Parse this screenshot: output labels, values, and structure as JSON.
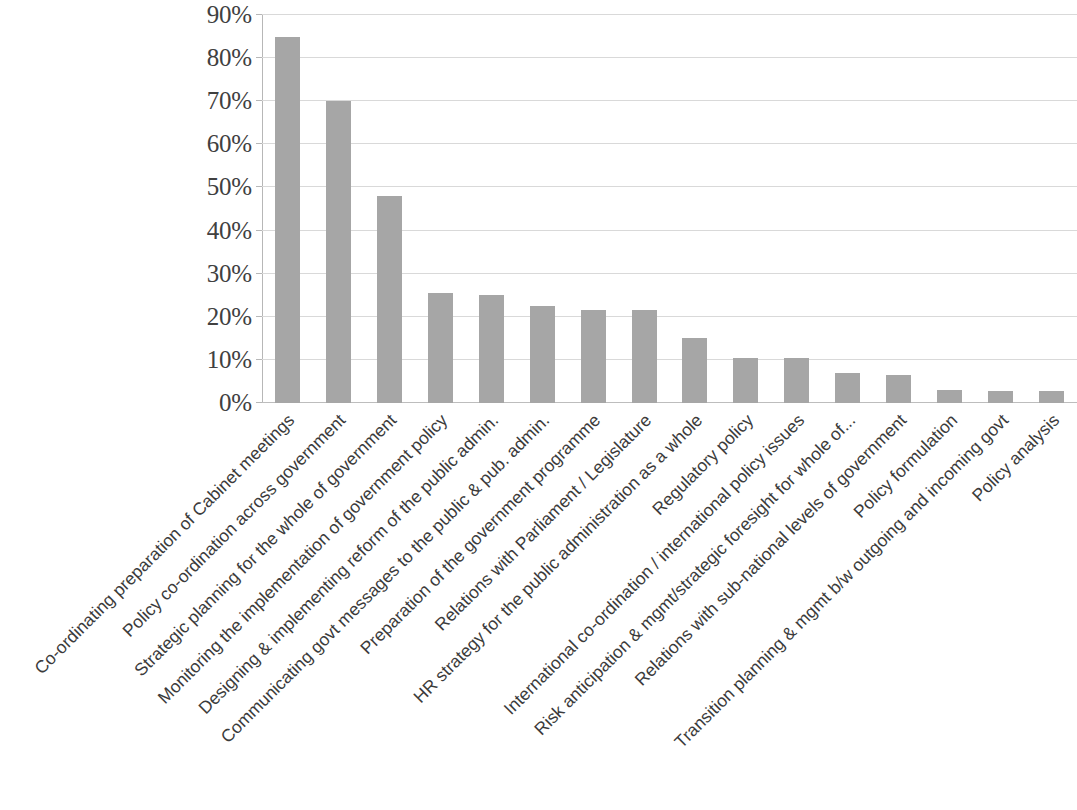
{
  "chart_data": {
    "type": "bar",
    "title": "",
    "subtitle": "",
    "xlabel": "",
    "ylabel": "",
    "ylim": [
      0,
      90
    ],
    "ytick_values": [
      0,
      10,
      20,
      30,
      40,
      50,
      60,
      70,
      80,
      90
    ],
    "ytick_labels": [
      "0%",
      "10%",
      "20%",
      "30%",
      "40%",
      "50%",
      "60%",
      "70%",
      "80%",
      "90%"
    ],
    "grid": true,
    "legend": false,
    "legend_position": "none",
    "bar_color": "#a6a6a6",
    "gridline_color": "#d9d9d9",
    "axis_color": "#b7b7b7",
    "categories": [
      "Co-ordinating preparation of Cabinet meetings",
      "Policy co-ordination across government",
      "Strategic planning for the whole of government",
      "Monitoring the implementation of government policy",
      "Designing & implementing reform of the public admin.",
      "Communicating govt messages to the public &  pub. admin.",
      "Preparation of the government programme",
      "Relations with Parliament / Legislature",
      "HR strategy for the public administration as a whole",
      "Regulatory policy",
      "International co-ordination / international policy issues",
      "Risk anticipation & mgmt/strategic foresight for whole of...",
      "Relations with sub-national levels of government",
      "Policy formulation",
      "Transition planning & mgmt b/w outgoing and incoming govt",
      "Policy analysis"
    ],
    "values": [
      85,
      70,
      48,
      25.5,
      25,
      22.5,
      21.5,
      21.5,
      15,
      10.5,
      10.5,
      7,
      6.5,
      3,
      2.8,
      2.8
    ]
  },
  "axis": {
    "y_ticks": [
      "90%",
      "80%",
      "70%",
      "60%",
      "50%",
      "40%",
      "30%",
      "20%",
      "10%",
      "0%"
    ]
  },
  "x_categories": [
    "Co-ordinating preparation of Cabinet meetings",
    "Policy co-ordination across government",
    "Strategic planning for the whole of government",
    "Monitoring the implementation of government policy",
    "Designing & implementing reform of the public admin.",
    "Communicating govt messages to the public &  pub. admin.",
    "Preparation of the government programme",
    "Relations with Parliament / Legislature",
    "HR strategy for the public administration as a whole",
    "Regulatory policy",
    "International co-ordination / international policy issues",
    "Risk anticipation & mgmt/strategic foresight for whole of...",
    "Relations with sub-national levels of government",
    "Policy formulation",
    "Transition planning & mgmt b/w outgoing and incoming govt",
    "Policy analysis"
  ]
}
